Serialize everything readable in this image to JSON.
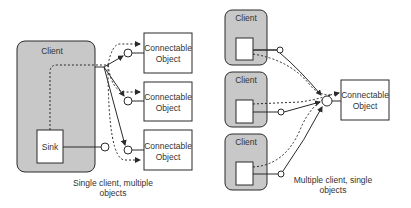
{
  "colors": {
    "client_fill": "#c8c8c8",
    "stroke": "#2a2a2a",
    "box_fill": "#ffffff",
    "text": "#333333"
  },
  "left_diagram": {
    "client_label": "Client",
    "sink_label": "Sink",
    "objects": [
      {
        "line1": "Connectable",
        "line2": "Object"
      },
      {
        "line1": "Connectable",
        "line2": "Object"
      },
      {
        "line1": "Connectable",
        "line2": "Object"
      }
    ],
    "caption_line1": "Single client, multiple",
    "caption_line2": "objects"
  },
  "right_diagram": {
    "clients": [
      {
        "label": "Client"
      },
      {
        "label": "Client"
      },
      {
        "label": "Client"
      }
    ],
    "object": {
      "line1": "Connectable",
      "line2": "Object"
    },
    "caption_line1": "Multiple client, single",
    "caption_line2": "objects"
  }
}
